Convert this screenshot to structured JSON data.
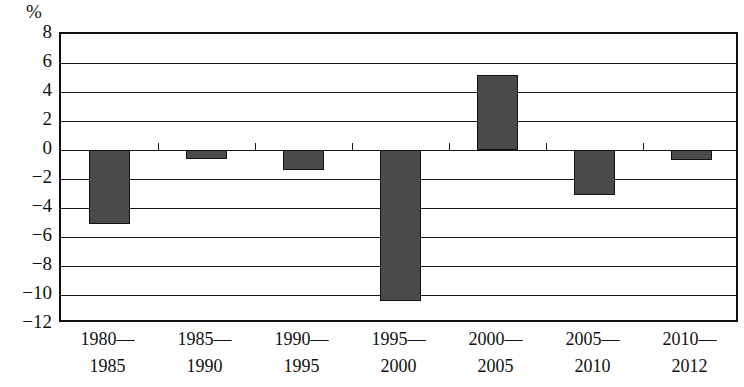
{
  "chart_data": {
    "type": "bar",
    "title": "",
    "subtitle": "",
    "xlabel": "",
    "ylabel": "%",
    "unit_caption": "%",
    "categories": [
      "1980—\n1985",
      "1985—\n1990",
      "1990—\n1995",
      "1995—\n2000",
      "2000—\n2005",
      "2005—\n2010",
      "2010—\n2012"
    ],
    "category_lines": [
      {
        "line1": "1980—",
        "line2": "1985"
      },
      {
        "line1": "1985—",
        "line2": "1990"
      },
      {
        "line1": "1990—",
        "line2": "1995"
      },
      {
        "line1": "1995—",
        "line2": "2000"
      },
      {
        "line1": "2000—",
        "line2": "2005"
      },
      {
        "line1": "2005—",
        "line2": "2010"
      },
      {
        "line1": "2010—",
        "line2": "2012"
      }
    ],
    "values": [
      -5.1,
      -0.6,
      -1.4,
      -10.4,
      5.2,
      -3.1,
      -0.7
    ],
    "ylim": [
      -12,
      8
    ],
    "yticks": [
      8,
      6,
      4,
      2,
      0,
      -2,
      -4,
      -6,
      -8,
      -10,
      -12
    ],
    "ytick_labels": [
      "8",
      "6",
      "4",
      "2",
      "0",
      "−2",
      "−4",
      "−6",
      "−8",
      "−10",
      "−12"
    ],
    "grid": true,
    "grid_axis": "y",
    "legend": null,
    "legend_position": "none",
    "bar_fill_color": "#4a4a4a",
    "bar_edge_color": "#111111",
    "axis_color": "#161616",
    "background_color": "#ffffff"
  }
}
